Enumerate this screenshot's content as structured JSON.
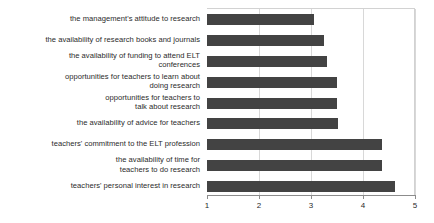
{
  "chart_data": {
    "type": "bar",
    "orientation": "horizontal",
    "title": "",
    "xlabel": "",
    "ylabel": "",
    "xlim": [
      1,
      5
    ],
    "xticks": [
      1,
      2,
      3,
      4,
      5
    ],
    "xtick_labels": [
      "1",
      "2",
      "3",
      "4",
      "5"
    ],
    "grid": true,
    "grid_axis": "x",
    "legend": false,
    "bar_color": "#434343",
    "categories": [
      "the management's attitude to research",
      "the availability of research books and journals",
      "the availability of funding to attend ELT\nconferences",
      "opportunities for teachers to learn about\ndoing research",
      "opportunities for teachers to\ntalk about research",
      "the availability of advice for teachers",
      "teachers' commitment to the ELT profession",
      "the availability of time for\nteachers to do research",
      "teachers' personal interest in research"
    ],
    "values": [
      3.05,
      3.25,
      3.3,
      3.5,
      3.5,
      3.52,
      4.37,
      4.37,
      4.62
    ]
  }
}
